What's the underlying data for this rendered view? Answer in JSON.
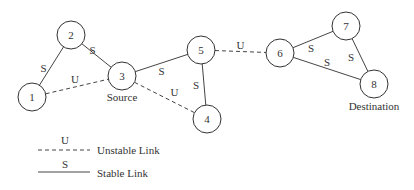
{
  "diagram": {
    "type": "network-graph",
    "nodes": [
      {
        "id": "1",
        "label": "1"
      },
      {
        "id": "2",
        "label": "2"
      },
      {
        "id": "3",
        "label": "3",
        "caption": "Source"
      },
      {
        "id": "4",
        "label": "4"
      },
      {
        "id": "5",
        "label": "5"
      },
      {
        "id": "6",
        "label": "6"
      },
      {
        "id": "7",
        "label": "7"
      },
      {
        "id": "8",
        "label": "8",
        "caption": "Destination"
      }
    ],
    "edges": [
      {
        "from": "1",
        "to": "2",
        "kind": "stable",
        "label": "S"
      },
      {
        "from": "2",
        "to": "3",
        "kind": "stable",
        "label": "S"
      },
      {
        "from": "1",
        "to": "3",
        "kind": "unstable",
        "label": "U"
      },
      {
        "from": "3",
        "to": "5",
        "kind": "stable",
        "label": "S"
      },
      {
        "from": "3",
        "to": "4",
        "kind": "unstable",
        "label": "U"
      },
      {
        "from": "5",
        "to": "4",
        "kind": "stable",
        "label": "S"
      },
      {
        "from": "5",
        "to": "6",
        "kind": "unstable",
        "label": "U"
      },
      {
        "from": "6",
        "to": "7",
        "kind": "stable",
        "label": "S"
      },
      {
        "from": "7",
        "to": "8",
        "kind": "stable",
        "label": "S"
      },
      {
        "from": "6",
        "to": "8",
        "kind": "stable",
        "label": "S"
      }
    ]
  },
  "legend": {
    "unstable": {
      "symbol": "U",
      "label": "Unstable Link"
    },
    "stable": {
      "symbol": "S",
      "label": "Stable Link"
    }
  }
}
